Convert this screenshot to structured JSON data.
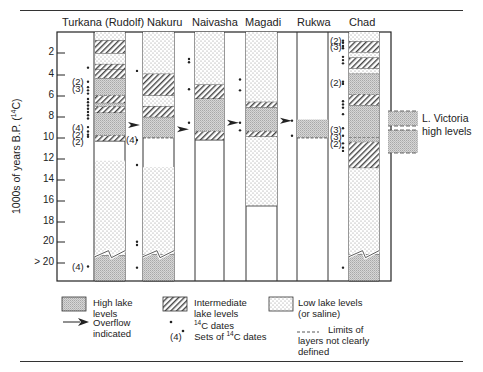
{
  "lakes": [
    {
      "name": "Turkana (Rudolf)",
      "x": 95,
      "w": 30
    },
    {
      "name": "Nakuru",
      "x": 143,
      "w": 31
    },
    {
      "name": "Naivasha",
      "x": 195,
      "w": 29
    },
    {
      "name": "Magadi",
      "x": 246,
      "w": 31
    },
    {
      "name": "Rukwa",
      "x": 297,
      "w": 31
    },
    {
      "name": "Chad",
      "x": 349,
      "w": 30
    }
  ],
  "axis": {
    "label": "1000s of years B.P. (14C)",
    "ticks": [
      "2",
      "4",
      "6",
      "8",
      "10",
      "12",
      "14",
      "16",
      "18",
      "20",
      "> 20"
    ]
  },
  "victoria": {
    "line1": "L. Victoria",
    "line2": "high levels"
  },
  "legend": {
    "high": "High lake levels",
    "high_l1": "High lake",
    "high_l2": "levels",
    "intermediate_l1": "Intermediate",
    "intermediate_l2": "lake levels",
    "low_l1": "Low lake levels",
    "low_l2": "(or saline)",
    "overflow_l1": "Overflow",
    "overflow_l2": "indicated",
    "dates": "C dates",
    "sets_prefix": "(4)",
    "sets": "Sets of ",
    "sets_suffix": "C dates",
    "c14_sup": "14",
    "limits_l1": "Limits of",
    "limits_l2": "layers  not clearly",
    "limits_l3": "defined"
  },
  "chart_data": {
    "type": "table",
    "ylabel": "1000s of years B.P. (14C)",
    "ylim": [
      0,
      22
    ],
    "yticks": [
      2,
      4,
      6,
      8,
      10,
      12,
      14,
      16,
      18,
      20,
      ">20"
    ],
    "categories": [
      "Turkana (Rudolf)",
      "Nakuru",
      "Naivasha",
      "Magadi",
      "Rukwa",
      "Chad"
    ],
    "series": [
      {
        "name": "Turkana (Rudolf)",
        "layers": [
          {
            "from": 0,
            "to": 0.8,
            "level": "low"
          },
          {
            "from": 0.8,
            "to": 2,
            "level": "intermediate"
          },
          {
            "from": 2,
            "to": 3,
            "level": "low"
          },
          {
            "from": 3,
            "to": 3.5,
            "level": "intermediate"
          },
          {
            "from": 3.5,
            "to": 4.3,
            "level": "intermediate"
          },
          {
            "from": 4.3,
            "to": 5.9,
            "level": "high"
          },
          {
            "from": 5.9,
            "to": 6.6,
            "level": "intermediate"
          },
          {
            "from": 6.6,
            "to": 6.9,
            "level": "high"
          },
          {
            "from": 6.9,
            "to": 7.5,
            "level": "intermediate"
          },
          {
            "from": 7.5,
            "to": 9.6,
            "level": "high"
          },
          {
            "from": 9.6,
            "to": 10.1,
            "level": "intermediate"
          },
          {
            "from": 10.1,
            "to": 11.9,
            "level": "none"
          },
          {
            "from": 11.9,
            "to": 20.7,
            "level": "low"
          },
          {
            "from": 20.7,
            "to": 22,
            "level": "high"
          }
        ],
        "overflow_at": 8.6
      },
      {
        "name": "Nakuru",
        "layers": [
          {
            "from": 0,
            "to": 3.9,
            "level": "low"
          },
          {
            "from": 3.9,
            "to": 5.9,
            "level": "intermediate"
          },
          {
            "from": 5.9,
            "to": 6.9,
            "level": "low"
          },
          {
            "from": 6.9,
            "to": 7.9,
            "level": "intermediate"
          },
          {
            "from": 7.9,
            "to": 9.8,
            "level": "high"
          },
          {
            "from": 9.8,
            "to": 12.5,
            "level": "none"
          },
          {
            "from": 12.5,
            "to": 20.6,
            "level": "low"
          },
          {
            "from": 20.6,
            "to": 22,
            "level": "high"
          }
        ],
        "overflow_at": 9.0
      },
      {
        "name": "Naivasha",
        "layers": [
          {
            "from": 0,
            "to": 4.9,
            "level": "low"
          },
          {
            "from": 4.9,
            "to": 6.2,
            "level": "intermediate"
          },
          {
            "from": 6.2,
            "to": 9.2,
            "level": "high"
          },
          {
            "from": 9.2,
            "to": 10,
            "level": "intermediate"
          },
          {
            "from": 10,
            "to": 22,
            "level": "none"
          }
        ],
        "overflow_at": 8.4
      },
      {
        "name": "Magadi",
        "layers": [
          {
            "from": 0,
            "to": 6.5,
            "level": "low"
          },
          {
            "from": 6.5,
            "to": 7.0,
            "level": "intermediate"
          },
          {
            "from": 7.0,
            "to": 9.2,
            "level": "high"
          },
          {
            "from": 9.2,
            "to": 9.7,
            "level": "intermediate"
          },
          {
            "from": 9.7,
            "to": 16.1,
            "level": "low"
          },
          {
            "from": 16.1,
            "to": 22,
            "level": "none"
          }
        ],
        "overflow_at": 8.2
      },
      {
        "name": "Rukwa",
        "layers": [
          {
            "from": 0,
            "to": 8.1,
            "level": "none"
          },
          {
            "from": 8.1,
            "to": 9.8,
            "level": "high"
          },
          {
            "from": 9.8,
            "to": 22,
            "level": "none"
          }
        ]
      },
      {
        "name": "Chad",
        "layers": [
          {
            "from": 0,
            "to": 0.9,
            "level": "low"
          },
          {
            "from": 0.9,
            "to": 1.9,
            "level": "intermediate"
          },
          {
            "from": 1.9,
            "to": 2.4,
            "level": "low"
          },
          {
            "from": 2.4,
            "to": 3.4,
            "level": "intermediate"
          },
          {
            "from": 3.4,
            "to": 3.9,
            "level": "low"
          },
          {
            "from": 3.9,
            "to": 5.8,
            "level": "high"
          },
          {
            "from": 5.8,
            "to": 6.8,
            "level": "intermediate"
          },
          {
            "from": 6.8,
            "to": 9.8,
            "level": "high"
          },
          {
            "from": 9.8,
            "to": 10.2,
            "level": "high"
          },
          {
            "from": 10.2,
            "to": 12.6,
            "level": "intermediate"
          },
          {
            "from": 12.6,
            "to": 20.6,
            "level": "low"
          },
          {
            "from": 20.6,
            "to": 22,
            "level": "high"
          }
        ]
      }
    ],
    "side_panel": "L. Victoria high levels",
    "legend": [
      "High lake levels",
      "Intermediate lake levels",
      "Low lake levels (or saline)",
      "Overflow indicated",
      "14C dates",
      "Sets of 14C dates",
      "Limits of layers not clearly defined"
    ]
  }
}
